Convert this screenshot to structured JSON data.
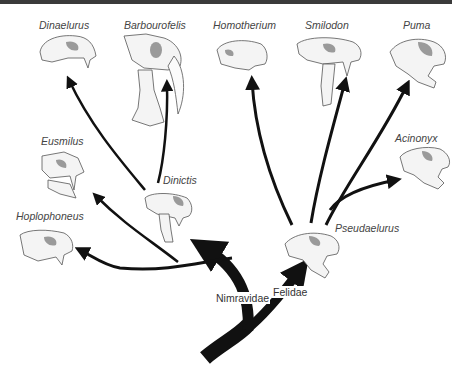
{
  "clades": [
    {
      "id": "nimravidae",
      "label": "Nimravidae"
    },
    {
      "id": "felidae",
      "label": "Felidae"
    }
  ],
  "taxa": [
    {
      "id": "dinaelurus",
      "label": "Dinaelurus",
      "clade": "nimravidae",
      "type": "terminal"
    },
    {
      "id": "barbourofelis",
      "label": "Barbourofelis",
      "clade": "nimravidae",
      "type": "terminal"
    },
    {
      "id": "eusmilus",
      "label": "Eusmilus",
      "clade": "nimravidae",
      "type": "terminal"
    },
    {
      "id": "dinictis",
      "label": "Dinictis",
      "clade": "nimravidae",
      "type": "ancestor"
    },
    {
      "id": "hoplophoneus",
      "label": "Hoplophoneus",
      "clade": "nimravidae",
      "type": "terminal"
    },
    {
      "id": "homotherium",
      "label": "Homotherium",
      "clade": "felidae",
      "type": "terminal"
    },
    {
      "id": "smilodon",
      "label": "Smilodon",
      "clade": "felidae",
      "type": "terminal"
    },
    {
      "id": "puma",
      "label": "Puma",
      "clade": "felidae",
      "type": "terminal"
    },
    {
      "id": "acinonyx",
      "label": "Acinonyx",
      "clade": "felidae",
      "type": "terminal"
    },
    {
      "id": "pseudaelurus",
      "label": "Pseudaelurus",
      "clade": "felidae",
      "type": "ancestor"
    }
  ],
  "edges": [
    {
      "from": "root",
      "to": "nimravidae"
    },
    {
      "from": "root",
      "to": "felidae"
    },
    {
      "from": "nimravidae",
      "to": "dinictis"
    },
    {
      "from": "nimravidae",
      "to": "hoplophoneus"
    },
    {
      "from": "nimravidae",
      "to": "eusmilus"
    },
    {
      "from": "nimravidae",
      "to": "dinaelurus"
    },
    {
      "from": "dinictis",
      "to": "barbourofelis"
    },
    {
      "from": "felidae",
      "to": "pseudaelurus"
    },
    {
      "from": "pseudaelurus",
      "to": "homotherium"
    },
    {
      "from": "pseudaelurus",
      "to": "smilodon"
    },
    {
      "from": "pseudaelurus",
      "to": "puma"
    },
    {
      "from": "pseudaelurus",
      "to": "acinonyx"
    }
  ],
  "colors": {
    "line": "#111111",
    "text": "#444444",
    "skull_fill": "#f4f4f4",
    "skull_stroke": "#555555",
    "skull_shade": "#9a9a9a"
  }
}
